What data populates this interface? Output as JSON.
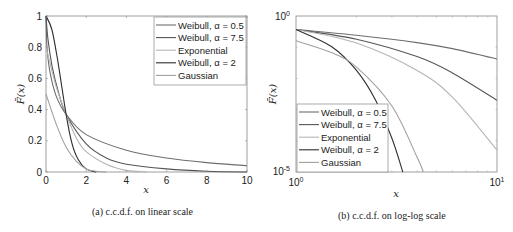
{
  "chart_data": [
    {
      "type": "line",
      "title": "",
      "caption": "(a) c.c.d.f. on linear scale",
      "xlabel": "x",
      "ylabel": "F̄(x)",
      "xlim": [
        0,
        10
      ],
      "ylim": [
        0,
        1
      ],
      "xscale": "linear",
      "yscale": "linear",
      "xticks": [
        "0",
        "2",
        "4",
        "6",
        "8",
        "10"
      ],
      "yticks": [
        "0",
        "0.2",
        "0.4",
        "0.6",
        "0.8",
        "1"
      ],
      "grid": false,
      "legend_position": "upper right",
      "series": [
        {
          "name": "Weibull, α = 0.5",
          "color": "#6e6e6e",
          "x": [
            0,
            0.05,
            0.2,
            0.5,
            1,
            2,
            4,
            6,
            8,
            10
          ],
          "values": [
            1.0,
            0.8,
            0.64,
            0.49,
            0.37,
            0.24,
            0.14,
            0.09,
            0.06,
            0.04
          ]
        },
        {
          "name": "Weibull, α = 7.5",
          "color": "#555555",
          "x": [
            0,
            0.1,
            0.3,
            0.6,
            1,
            2,
            3,
            4,
            6,
            8,
            10
          ],
          "values": [
            1.0,
            0.85,
            0.68,
            0.52,
            0.37,
            0.18,
            0.09,
            0.05,
            0.02,
            0.005,
            0.0
          ]
        },
        {
          "name": "Exponential",
          "color": "#b4b4b4",
          "x": [
            0,
            0.5,
            1,
            1.5,
            2,
            3,
            4,
            5
          ],
          "values": [
            0.8,
            0.55,
            0.37,
            0.22,
            0.13,
            0.05,
            0.01,
            0.0
          ]
        },
        {
          "name": "Weibull, α = 2",
          "color": "#2e2e2e",
          "x": [
            0,
            0.3,
            0.6,
            1,
            1.3,
            1.6,
            2,
            2.5
          ],
          "values": [
            1.0,
            0.91,
            0.7,
            0.37,
            0.18,
            0.08,
            0.02,
            0.0
          ]
        },
        {
          "name": "Gaussian",
          "color": "#a0a0a0",
          "x": [
            0,
            0.5,
            1,
            1.5,
            2,
            2.5,
            3
          ],
          "values": [
            0.5,
            0.31,
            0.16,
            0.07,
            0.02,
            0.005,
            0.0
          ]
        }
      ]
    },
    {
      "type": "line",
      "title": "",
      "caption": "(b) c.c.d.f. on log-log scale",
      "xlabel": "x",
      "ylabel": "F̄(x)",
      "xlim": [
        1,
        10
      ],
      "ylim": [
        1e-05,
        1
      ],
      "xscale": "log",
      "yscale": "log",
      "xticks": [
        "10^0",
        "10^1"
      ],
      "yticks": [
        "10^-5",
        "10^0"
      ],
      "grid": false,
      "legend_position": "lower left",
      "series": [
        {
          "name": "Weibull, α = 0.5",
          "color": "#6e6e6e",
          "x": [
            1,
            2,
            4,
            6,
            10
          ],
          "values": [
            0.37,
            0.24,
            0.14,
            0.09,
            0.042
          ]
        },
        {
          "name": "Weibull, α = 7.5",
          "color": "#555555",
          "x": [
            1,
            2,
            4,
            6,
            10
          ],
          "values": [
            0.37,
            0.18,
            0.05,
            0.015,
            0.002
          ]
        },
        {
          "name": "Exponential",
          "color": "#b4b4b4",
          "x": [
            1,
            2,
            4,
            6,
            10
          ],
          "values": [
            0.37,
            0.135,
            0.018,
            0.0025,
            5e-05
          ]
        },
        {
          "name": "Weibull, α = 2",
          "color": "#2e2e2e",
          "x": [
            1,
            1.5,
            2,
            2.5,
            3,
            3.4
          ],
          "values": [
            0.37,
            0.105,
            0.018,
            0.0019,
            0.00012,
            1e-05
          ]
        },
        {
          "name": "Gaussian",
          "color": "#a0a0a0",
          "x": [
            1,
            1.5,
            2,
            3,
            4,
            4.3
          ],
          "values": [
            0.16,
            0.067,
            0.023,
            0.0013,
            3e-05,
            1e-05
          ]
        }
      ]
    }
  ],
  "captions": {
    "left": "(a) c.c.d.f. on linear scale",
    "right": "(b) c.c.d.f. on log-log scale"
  },
  "axes": {
    "left": {
      "xlabel": "x",
      "ylabel": "F̄(x)",
      "xticks": [
        "0",
        "2",
        "4",
        "6",
        "8",
        "10"
      ],
      "yticks": [
        "0",
        "0.2",
        "0.4",
        "0.6",
        "0.8",
        "1"
      ]
    },
    "right": {
      "xlabel": "x",
      "ylabel": "F̄(x)",
      "xtick_min": "10",
      "xtick_min_exp": "0",
      "xtick_max": "10",
      "xtick_max_exp": "1",
      "ytick_min": "10",
      "ytick_min_exp": "-5",
      "ytick_max": "10",
      "ytick_max_exp": "0"
    }
  },
  "legend": [
    "Weibull, α = 0.5",
    "Weibull, α = 7.5",
    "Exponential",
    "Weibull, α = 2",
    "Gaussian"
  ]
}
